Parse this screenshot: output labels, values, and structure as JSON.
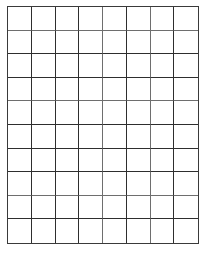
{
  "grid": {
    "columns": 8,
    "rows": 10,
    "line_color": "#2e2e2e",
    "background": "#ffffff",
    "cells_filled": []
  }
}
